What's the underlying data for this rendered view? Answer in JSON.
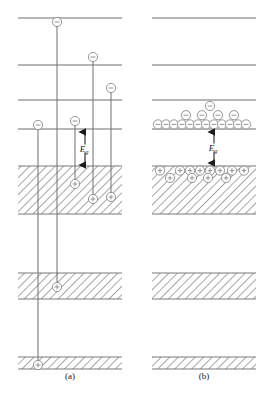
{
  "figure": {
    "type": "energy-band-diagram",
    "background": "#ffffff",
    "line_color": "#6e6e6e",
    "band_edge_color": "#7a7a7a",
    "hatch_color": "#8a8a8a",
    "particle_color": "#8a8a8a",
    "arrow_color": "#222222",
    "label_color": "#1a1a1a"
  },
  "panels": [
    {
      "id": "a",
      "caption": "(a)",
      "caption_x": 70,
      "caption_y": 378,
      "x_left": 18,
      "x_right": 122,
      "levels": [
        {
          "name": "level-1",
          "y": 18
        },
        {
          "name": "level-2",
          "y": 65
        },
        {
          "name": "level-3",
          "y": 100
        },
        {
          "name": "level-4",
          "y": 129
        }
      ],
      "bands": [
        {
          "name": "valence-band",
          "y_top": 166,
          "y_bottom": 214,
          "hatched": true
        },
        {
          "name": "inner-band-1",
          "y_top": 273,
          "y_bottom": 299,
          "hatched": true
        },
        {
          "name": "core-band",
          "y_top": 357,
          "y_bottom": 369,
          "hatched": true
        }
      ],
      "gap_label": {
        "text": "Eg",
        "sub": "g",
        "main": "E",
        "x": 85,
        "y": 150,
        "arrow_x": 85,
        "arrow_top": 131,
        "arrow_bottom": 166
      },
      "transitions": [
        {
          "name": "transition-1",
          "x": 38,
          "electron_y": 125,
          "hole_y": 365
        },
        {
          "name": "transition-2",
          "x": 57,
          "electron_y": 22,
          "hole_y": 287
        },
        {
          "name": "transition-3",
          "x": 75,
          "electron_y": 121,
          "hole_y": 184
        },
        {
          "name": "transition-4",
          "x": 93,
          "electron_y": 57,
          "hole_y": 199
        },
        {
          "name": "transition-5",
          "x": 111,
          "electron_y": 88,
          "hole_y": 197
        }
      ]
    },
    {
      "id": "b",
      "caption": "(b)",
      "caption_x": 204,
      "caption_y": 378,
      "x_left": 152,
      "x_right": 256,
      "levels": [
        {
          "name": "level-1",
          "y": 18
        },
        {
          "name": "level-2",
          "y": 65
        },
        {
          "name": "level-3",
          "y": 100
        },
        {
          "name": "conduction-band-edge",
          "y": 129
        }
      ],
      "bands": [
        {
          "name": "valence-band",
          "y_top": 166,
          "y_bottom": 214,
          "hatched": true
        },
        {
          "name": "inner-band-1",
          "y_top": 273,
          "y_bottom": 299,
          "hatched": true
        },
        {
          "name": "core-band",
          "y_top": 357,
          "y_bottom": 369,
          "hatched": true
        }
      ],
      "gap_label": {
        "text": "Eg",
        "sub": "g",
        "main": "E",
        "x": 214,
        "y": 150,
        "arrow_x": 214,
        "arrow_top": 131,
        "arrow_bottom": 164
      },
      "electron_pile": {
        "name": "electron-pile",
        "baseline_y": 129,
        "row1": [
          158,
          166,
          174,
          182,
          190,
          198,
          206,
          214,
          222,
          230,
          238,
          246
        ],
        "row2": [
          186,
          202,
          218,
          234
        ],
        "row3": [
          210
        ]
      },
      "hole_pile": {
        "name": "hole-pile",
        "baseline_y": 166,
        "row1": [
          160,
          180,
          190,
          200,
          210,
          220,
          232,
          244
        ],
        "row2": [
          170,
          192,
          208,
          226
        ]
      }
    }
  ],
  "particles": {
    "electron": {
      "name": "electron",
      "glyph": "minus",
      "radius": 4.6
    },
    "hole": {
      "name": "hole",
      "glyph": "plus",
      "radius": 4.6
    }
  }
}
